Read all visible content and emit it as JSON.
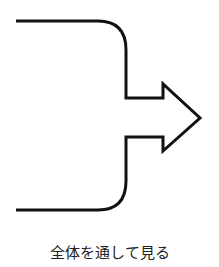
{
  "diagram": {
    "shape": "bracket-arrow-right",
    "stroke_color": "#111111",
    "caption": "全体を通して見る"
  }
}
